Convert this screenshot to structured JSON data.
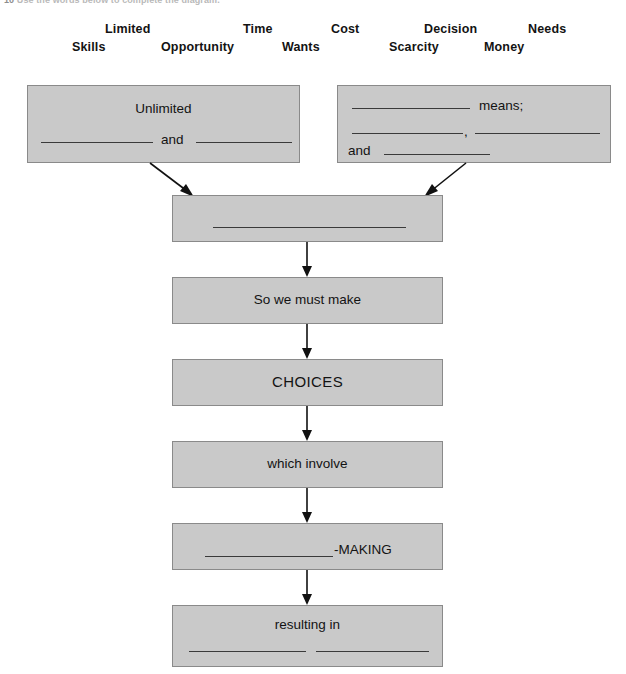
{
  "instruction": {
    "number": "10",
    "text": "Use the words below to complete the diagram."
  },
  "word_bank": {
    "words": [
      {
        "label": "Limited",
        "x": 105,
        "y": 0
      },
      {
        "label": "Time",
        "x": 243,
        "y": 0
      },
      {
        "label": "Cost",
        "x": 331,
        "y": 0
      },
      {
        "label": "Decision",
        "x": 424,
        "y": 0
      },
      {
        "label": "Needs",
        "x": 528,
        "y": 0
      },
      {
        "label": "Skills",
        "x": 72,
        "y": 18
      },
      {
        "label": "Opportunity",
        "x": 161,
        "y": 18
      },
      {
        "label": "Wants",
        "x": 282,
        "y": 18
      },
      {
        "label": "Scarcity",
        "x": 389,
        "y": 18
      },
      {
        "label": "Money",
        "x": 484,
        "y": 18
      }
    ]
  },
  "diagram": {
    "box_top_left": {
      "heading": "Unlimited",
      "connector_word": "and"
    },
    "box_top_right": {
      "word_means": "means;",
      "comma": ",",
      "word_and": "and"
    },
    "box_combined": {
      "text": ""
    },
    "box_must_make": {
      "text": "So we must make"
    },
    "box_choices": {
      "text": "CHOICES"
    },
    "box_which_involve": {
      "text": "which involve"
    },
    "box_making": {
      "text": "-MAKING"
    },
    "box_resulting": {
      "text": "resulting in"
    }
  },
  "colors": {
    "box_fill": "#c9c9c9",
    "box_border": "#8a8a8a",
    "rule": "#3a3a3a",
    "arrow": "#111111",
    "text": "#131313"
  }
}
